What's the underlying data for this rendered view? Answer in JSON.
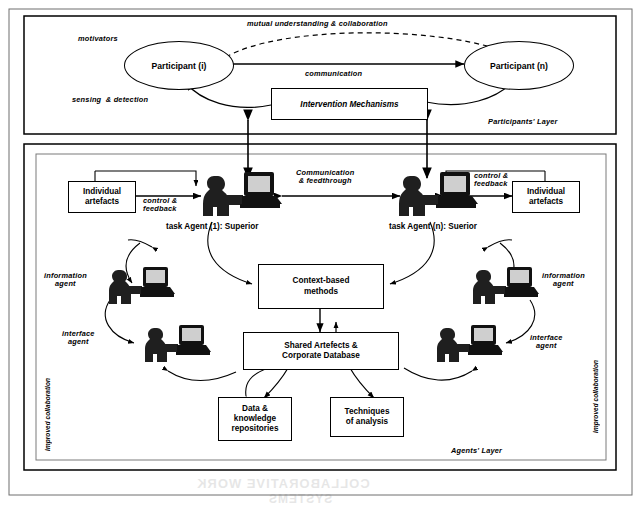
{
  "diagram": {
    "colors": {
      "stroke": "#000000",
      "fill": "#ffffff",
      "figure_dark": "#1a1a1a",
      "figure_mid": "#4d4d4d"
    }
  },
  "participants_layer": {
    "layer_label": "Participants' Layer",
    "side_labels": {
      "motivators": "motivators",
      "sensing": "sensing  & detection"
    },
    "nodes": {
      "participant_i": "Participant (i)",
      "participant_n": "Participant (n)",
      "intervention": "Intervention Mechanisms"
    },
    "edges": {
      "mutual": "mutual understanding & collaboration",
      "communication": "communication"
    }
  },
  "agents_layer": {
    "layer_label": "Agents' Layer",
    "vertical_labels": {
      "left": "improved collaboration",
      "right": "improved collaboration"
    },
    "nodes": {
      "individual_artefacts_left": "Individual\nartefacts",
      "individual_artefacts_right": "Individual\nartefacts",
      "context_methods": "Context-based\nmethods",
      "shared_artefacts": "Shared Artefects &\nCorporate Database",
      "data_repositories": "Data &\nknowledge\nrepositories",
      "techniques": "Techniques\nof analysis"
    },
    "agent_labels": {
      "task_agent_1": "task Agent (1): Superior",
      "task_agent_n": "task Agent (n): Suerior",
      "information_agent_left": "information\nagent",
      "information_agent_right": "information\nagent",
      "interface_agent_left": "interface\nagent",
      "interface_agent_right": "interface\nagent"
    },
    "edges": {
      "control_feedback_left": "control &\nfeedback",
      "control_feedback_right": "control &\nfeedback",
      "control_feedback_artefact_left": "control &\nfeedback",
      "communication_feedthrough": "Communication\n& feedthrough"
    }
  },
  "background_text": {
    "line1": "COLLABORATIVE WORK",
    "line2": "SYSTEMS"
  }
}
